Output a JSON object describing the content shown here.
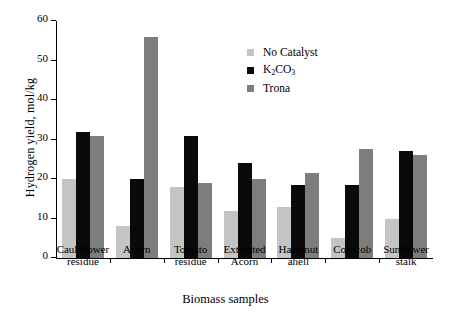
{
  "chart_data": {
    "type": "bar",
    "title": "",
    "xlabel": "Biomass samples",
    "ylabel": "Hydrogen yield, mol/kg",
    "ylim": [
      0,
      60
    ],
    "yticks": [
      0,
      10,
      20,
      30,
      40,
      50,
      60
    ],
    "grid": false,
    "legend_position": "upper-right-inside",
    "categories": [
      "Cauliflower residue",
      "Acorn",
      "Tomato residue",
      "Extracted Acorn",
      "Hazelnut ahell",
      "Corncob",
      "Sunflower stalk"
    ],
    "category_lines": [
      [
        "Cauliflower",
        "residue"
      ],
      [
        "Acorn",
        ""
      ],
      [
        "Tomato",
        "residue"
      ],
      [
        "Extracted",
        "Acorn"
      ],
      [
        "Hazelnut",
        "ahell"
      ],
      [
        "Corncob",
        ""
      ],
      [
        "Sunflower",
        "stalk"
      ]
    ],
    "series": [
      {
        "name": "No Catalyst",
        "name_html": "No Catalyst",
        "color": "#c4c4c4",
        "values": [
          20,
          8,
          18,
          12,
          13,
          5,
          10
        ]
      },
      {
        "name": "K2CO3",
        "name_html": "K<sub>2</sub>CO<sub>3</sub>",
        "color": "#0a0a0a",
        "values": [
          32,
          20,
          31,
          24,
          18.5,
          18.5,
          27
        ]
      },
      {
        "name": "Trona",
        "name_html": "Trona",
        "color": "#7d7d7d",
        "values": [
          31,
          56,
          19,
          20,
          21.5,
          27.5,
          26
        ]
      }
    ]
  },
  "axis": {
    "y_title": "Hydrogen yield, mol/kg",
    "x_title": "Biomass samples",
    "ytick_labels": [
      "0",
      "10",
      "20",
      "30",
      "40",
      "50",
      "60"
    ]
  },
  "legend": {
    "items": [
      {
        "label": "No Catalyst",
        "color": "#c4c4c4"
      },
      {
        "label": "K2CO3",
        "color": "#0a0a0a"
      },
      {
        "label": "Trona",
        "color": "#7d7d7d"
      }
    ]
  }
}
